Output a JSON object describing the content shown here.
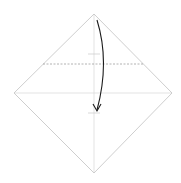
{
  "diagram": {
    "type": "origami-fold-step",
    "colors": {
      "background": "#ffffff",
      "paper_edge": "#c8c8c8",
      "crease": "#dcdcdc",
      "fold_line": "#a0a0a0",
      "arrow": "#1a1a1a"
    },
    "diamond": {
      "top": [
        94,
        14
      ],
      "right": [
        172,
        93
      ],
      "bottom": [
        94,
        173
      ],
      "left": [
        14,
        93
      ]
    },
    "fold_line": {
      "y": 64,
      "x1": 43,
      "x2": 143,
      "style": "dashed"
    },
    "creases": {
      "vertical_x": 94,
      "horizontal_y": 93
    },
    "tick_marks": [
      {
        "y": 54,
        "x1": 88,
        "x2": 100
      },
      {
        "y": 113,
        "x1": 88,
        "x2": 100
      }
    ],
    "arrow": {
      "start": [
        97,
        20
      ],
      "end": [
        97,
        110
      ],
      "direction": "down"
    }
  }
}
